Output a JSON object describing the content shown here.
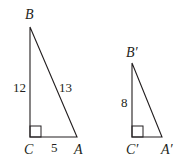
{
  "figure": {
    "triangle_abc": {
      "vertices": {
        "B": "B",
        "C": "C",
        "A": "A"
      },
      "sides": {
        "BC": "12",
        "BA": "13",
        "CA": "5"
      },
      "right_angle_at": "C"
    },
    "triangle_abc_prime": {
      "vertices": {
        "B": "B′",
        "C": "C′",
        "A": "A′"
      },
      "sides": {
        "BC": "8"
      },
      "right_angle_at": "C′"
    },
    "stroke_color": "#231f20"
  }
}
